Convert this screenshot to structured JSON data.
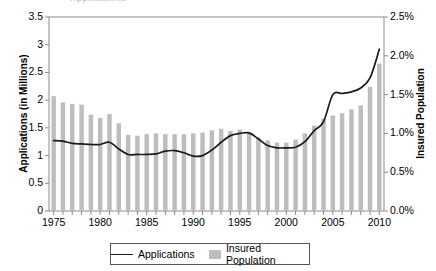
{
  "clipped_header": "Applications",
  "legend": {
    "items": [
      {
        "label": "Applications",
        "marker": "line",
        "color": "#1a1a1a"
      },
      {
        "label": "Insured Population",
        "marker": "swatch",
        "color": "#bdbdbd"
      }
    ]
  },
  "chart_data": {
    "type": "bar",
    "title": "",
    "subtitle": "",
    "xlabel": "",
    "ylabel": "Applications (in Millions)",
    "y2label": "Insured Population",
    "ylim": [
      0,
      3.5
    ],
    "y2lim": [
      0,
      0.025
    ],
    "yticks": [
      "0",
      "0.5",
      "1",
      "1.5",
      "2",
      "2.5",
      "3",
      "3.5"
    ],
    "ytick_values": [
      0,
      0.5,
      1,
      1.5,
      2,
      2.5,
      3,
      3.5
    ],
    "y2ticks": [
      "0.0%",
      "0.5%",
      "1.0%",
      "1.5%",
      "2.0%",
      "2.5%"
    ],
    "y2tick_values": [
      0,
      0.005,
      0.01,
      0.015,
      0.02,
      0.025
    ],
    "xticks": [
      "1975",
      "1980",
      "1985",
      "1990",
      "1995",
      "2000",
      "2005",
      "2010"
    ],
    "xtick_values": [
      1975,
      1980,
      1985,
      1990,
      1995,
      2000,
      2005,
      2010
    ],
    "grid": false,
    "legend_position": "bottom",
    "x": [
      1975,
      1976,
      1977,
      1978,
      1979,
      1980,
      1981,
      1982,
      1983,
      1984,
      1985,
      1986,
      1987,
      1988,
      1989,
      1990,
      1991,
      1992,
      1993,
      1994,
      1995,
      1996,
      1997,
      1998,
      1999,
      2000,
      2001,
      2002,
      2003,
      2004,
      2005,
      2006,
      2007,
      2008,
      2009,
      2010
    ],
    "series": [
      {
        "name": "Insured Population",
        "type": "bar",
        "axis": "right",
        "unit": "percent",
        "color": "#bdbdbd",
        "values": [
          0.0148,
          0.014,
          0.0138,
          0.0137,
          0.0124,
          0.012,
          0.0125,
          0.0113,
          0.0098,
          0.0097,
          0.0099,
          0.01,
          0.0099,
          0.0099,
          0.0099,
          0.01,
          0.0101,
          0.0104,
          0.0106,
          0.0103,
          0.0105,
          0.01,
          0.0095,
          0.0091,
          0.0088,
          0.0088,
          0.0092,
          0.01,
          0.011,
          0.0119,
          0.0123,
          0.0126,
          0.0131,
          0.0136,
          0.016,
          0.019
        ]
      },
      {
        "name": "Applications",
        "type": "line",
        "axis": "left",
        "unit": "millions",
        "color": "#1a1a1a",
        "values": [
          1.27,
          1.26,
          1.22,
          1.21,
          1.2,
          1.2,
          1.24,
          1.12,
          1.02,
          1.02,
          1.02,
          1.03,
          1.08,
          1.09,
          1.05,
          0.99,
          1.0,
          1.1,
          1.24,
          1.36,
          1.4,
          1.41,
          1.3,
          1.18,
          1.14,
          1.14,
          1.15,
          1.25,
          1.45,
          1.61,
          2.1,
          2.12,
          2.15,
          2.22,
          2.4,
          2.92
        ]
      }
    ]
  }
}
